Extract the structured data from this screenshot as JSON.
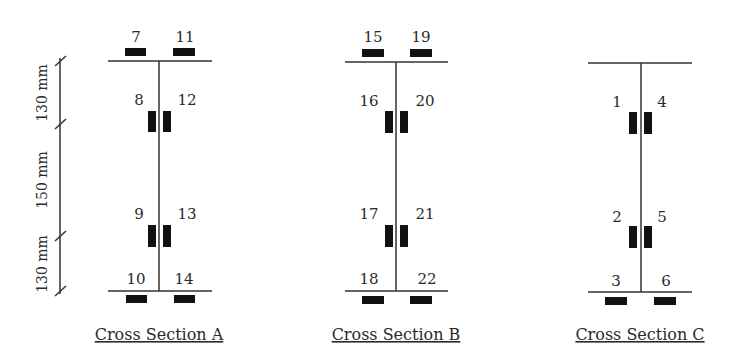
{
  "dimensions": {
    "top": "130 mm",
    "middle": "150 mm",
    "bottom": "130 mm"
  },
  "sections": [
    {
      "caption": "Cross Section A",
      "gauges": {
        "top_left": "7",
        "top_right": "11",
        "upper_left": "8",
        "upper_right": "12",
        "lower_left": "9",
        "lower_right": "13",
        "bottom_left": "10",
        "bottom_right": "14"
      }
    },
    {
      "caption": "Cross Section B",
      "gauges": {
        "top_left": "15",
        "top_right": "19",
        "upper_left": "16",
        "upper_right": "20",
        "lower_left": "17",
        "lower_right": "21",
        "bottom_left": "18",
        "bottom_right": "22"
      }
    },
    {
      "caption": "Cross Section C",
      "gauges": {
        "upper_left": "1",
        "upper_right": "4",
        "lower_left": "2",
        "lower_right": "5",
        "bottom_left": "3",
        "bottom_right": "6"
      }
    }
  ],
  "colors": {
    "line": "#333333",
    "gauge": "#111111",
    "text": "#2a2a2a"
  }
}
